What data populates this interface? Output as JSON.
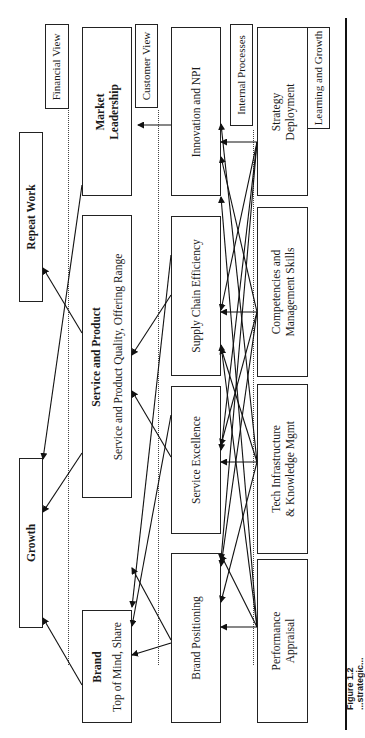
{
  "perspectives": {
    "financial": "Financial View",
    "customer": "Customer View",
    "internal": "Internal Processes",
    "learning": "Learning and Growth"
  },
  "financial_boxes": {
    "repeat_work": "Repeat Work",
    "growth": "Growth"
  },
  "customer_boxes": {
    "market_leadership": "Market Leadership",
    "service_product_title": "Service and Product",
    "service_product_sub": "Service and Product Quality, Offering Range",
    "brand_title": "Brand",
    "brand_sub": "Top of Mind, Share"
  },
  "internal_boxes": {
    "innovation": "Innovation and NPI",
    "supply_chain": "Supply Chain Efficiency",
    "service_excellence": "Service Excellence",
    "brand_positioning": "Brand Positioning"
  },
  "learning_boxes": {
    "strategy_line1": "Strategy",
    "strategy_line2": "Deployment",
    "competencies_line1": "Competencies and",
    "competencies_line2": "Management Skills",
    "tech_line1": "Tech Infrastructure",
    "tech_line2": "& Knowledge Mgmt",
    "performance_line1": "Performance",
    "performance_line2": "Appraisal"
  },
  "caption": "Figure 1.2   ...strategic..."
}
